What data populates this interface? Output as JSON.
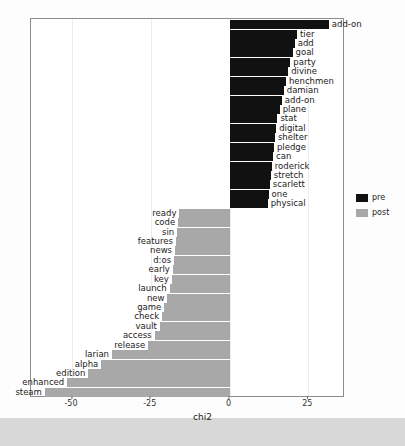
{
  "chart_data": {
    "type": "bar",
    "orientation": "horizontal",
    "title": "",
    "xlabel": "chi2",
    "ylabel": "",
    "xlim": [
      -63,
      36
    ],
    "xticks": [
      -50,
      -25,
      0,
      25
    ],
    "xticklabels": [
      "-50",
      "-25",
      "0",
      "25"
    ],
    "grid": true,
    "legend": {
      "position": "right",
      "entries": [
        {
          "name": "pre",
          "color": "#111111"
        },
        {
          "name": "post",
          "color": "#a8a8a8"
        }
      ]
    },
    "series": [
      {
        "name": "pre",
        "color": "#111111",
        "points": [
          {
            "label": "add-on",
            "value": 31.5
          },
          {
            "label": "tier",
            "value": 21.4
          },
          {
            "label": "add",
            "value": 20.7
          },
          {
            "label": "goal",
            "value": 20.0
          },
          {
            "label": "party",
            "value": 19.3
          },
          {
            "label": "divine",
            "value": 18.6
          },
          {
            "label": "henchmen",
            "value": 17.9
          },
          {
            "label": "damian",
            "value": 17.2
          },
          {
            "label": "add-on",
            "value": 16.6
          },
          {
            "label": "plane",
            "value": 15.9
          },
          {
            "label": "stat",
            "value": 15.2
          },
          {
            "label": "digital",
            "value": 14.8
          },
          {
            "label": "shelter",
            "value": 14.4
          },
          {
            "label": "pledge",
            "value": 14.1
          },
          {
            "label": "can",
            "value": 13.8
          },
          {
            "label": "roderick",
            "value": 13.4
          },
          {
            "label": "stretch",
            "value": 13.1
          },
          {
            "label": "scarlett",
            "value": 12.8
          },
          {
            "label": "one",
            "value": 12.4
          },
          {
            "label": "physical",
            "value": 12.1
          }
        ]
      },
      {
        "name": "post",
        "color": "#a8a8a8",
        "points": [
          {
            "label": "ready",
            "value": -15.9
          },
          {
            "label": "code",
            "value": -16.3
          },
          {
            "label": "sin",
            "value": -16.6
          },
          {
            "label": "features",
            "value": -17.0
          },
          {
            "label": "news",
            "value": -17.3
          },
          {
            "label": "d:os",
            "value": -17.6
          },
          {
            "label": "early",
            "value": -18.0
          },
          {
            "label": "key",
            "value": -18.3
          },
          {
            "label": "launch",
            "value": -19.0
          },
          {
            "label": "new",
            "value": -19.7
          },
          {
            "label": "game",
            "value": -20.7
          },
          {
            "label": "check",
            "value": -21.4
          },
          {
            "label": "vault",
            "value": -22.1
          },
          {
            "label": "access",
            "value": -23.8
          },
          {
            "label": "release",
            "value": -25.8
          },
          {
            "label": "larian",
            "value": -37.3
          },
          {
            "label": "alpha",
            "value": -40.7
          },
          {
            "label": "edition",
            "value": -44.8
          },
          {
            "label": "enhanced",
            "value": -51.5
          },
          {
            "label": "steam",
            "value": -58.6
          }
        ]
      }
    ]
  }
}
